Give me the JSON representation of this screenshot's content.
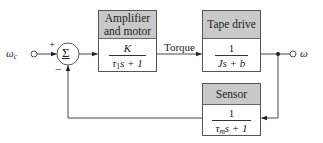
{
  "diagram": {
    "type": "feedback-control-block-diagram",
    "input": {
      "label": "ω",
      "subscript": "c"
    },
    "output": {
      "label": "ω"
    },
    "summing_junction": {
      "symbol": "Σ",
      "plus_sign": "+",
      "minus_sign": "−"
    },
    "signals": {
      "torque_label": "Torque"
    },
    "blocks": {
      "amplifier": {
        "title_line1": "Amplifier",
        "title_line2": "and motor",
        "numerator": "K",
        "den_prefix": "τ",
        "den_sub": "1",
        "den_suffix": "s + 1"
      },
      "tape_drive": {
        "title": "Tape drive",
        "numerator": "1",
        "denominator": "Js + b"
      },
      "sensor": {
        "title": "Sensor",
        "numerator": "1",
        "den_prefix": "τ",
        "den_sub": "m",
        "den_suffix": "s + 1"
      }
    },
    "colors": {
      "header_fill": "#c9c9c9",
      "line": "#333333",
      "background": "#ffffff"
    }
  }
}
